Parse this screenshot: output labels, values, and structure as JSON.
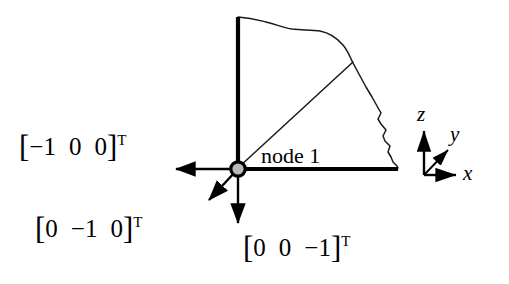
{
  "figure": {
    "background_color": "#ffffff",
    "line_color": "#000000",
    "node_fill_color": "#b9b9b9"
  },
  "node": {
    "label": "node 1",
    "marker": "filled-circle"
  },
  "vectors": [
    {
      "id": "negative-x",
      "open_bracket": "[",
      "components": [
        "−1",
        "0",
        "0"
      ],
      "close_bracket": "]",
      "transpose": "T",
      "direction": "left"
    },
    {
      "id": "negative-y",
      "open_bracket": "[",
      "components": [
        "0",
        "−1",
        "0"
      ],
      "close_bracket": "]",
      "transpose": "T",
      "direction": "down-left"
    },
    {
      "id": "negative-z",
      "open_bracket": "[",
      "components": [
        "0",
        "0",
        "−1"
      ],
      "close_bracket": "]",
      "transpose": "T",
      "direction": "down"
    }
  ],
  "axes": {
    "z": "z",
    "y": "y",
    "x": "x"
  },
  "geometry": {
    "mesh_boundary_description": "quarter-disc body with jagged right edge",
    "vertical_edge": "thick",
    "horizontal_edge": "thick"
  }
}
